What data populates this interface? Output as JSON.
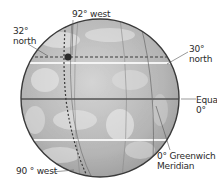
{
  "diagram": {
    "type": "globe-coordinates",
    "colors": {
      "background": "#ffffff",
      "globe_fill": "#b9b9b9",
      "globe_outline": "#3a3a3a",
      "equator": "#5a5a5a",
      "highlight_latitude": "#f2f2f2",
      "dashed": "#3a3a3a",
      "text": "#2a2a2a"
    },
    "labels": {
      "west92": "92° west",
      "north32_line1": "32°",
      "north32_line2": "north",
      "north30_line1": "30°",
      "north30_line2": "north",
      "equator_line1": "Equator",
      "equator_line2": "0°",
      "greenwich_line1": "0° Greenwich",
      "greenwich_line2": "Meridian",
      "west90": "90 ° west"
    },
    "points": [
      {
        "name": "location",
        "lat": "32° north",
        "lon": "92° west"
      }
    ]
  }
}
